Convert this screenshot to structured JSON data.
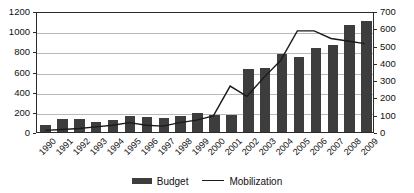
{
  "chart_data": {
    "type": "bar",
    "title": "",
    "subtitle": "",
    "xlabel": "",
    "ylabel": "",
    "grid": true,
    "legend_position": "bottom",
    "categories": [
      "1990",
      "1991",
      "1992",
      "1993",
      "1994",
      "1995",
      "1996",
      "1997",
      "1998",
      "1999",
      "2000",
      "2001",
      "2002",
      "2003",
      "2004",
      "2005",
      "2006",
      "2007",
      "2008",
      "2009"
    ],
    "series": [
      {
        "name": "Budget",
        "type": "bar",
        "axis": "left",
        "color": "#3d3d3d",
        "values": [
          65,
          130,
          125,
          100,
          115,
          155,
          150,
          140,
          155,
          190,
          165,
          165,
          625,
          640,
          770,
          745,
          835,
          865,
          1060,
          1100
        ]
      },
      {
        "name": "Mobilization",
        "type": "line",
        "axis": "right",
        "color": "#1a1a1a",
        "values": [
          10,
          15,
          20,
          30,
          40,
          55,
          40,
          35,
          55,
          70,
          95,
          270,
          210,
          320,
          420,
          595,
          595,
          550,
          535,
          520
        ]
      }
    ],
    "axes": {
      "left": {
        "min": 0,
        "max": 1200,
        "step": 200,
        "ticks": [
          "0",
          "200",
          "400",
          "600",
          "800",
          "1000",
          "1200"
        ]
      },
      "right": {
        "min": 0,
        "max": 700,
        "step": 100,
        "ticks": [
          "0",
          "100",
          "200",
          "300",
          "400",
          "500",
          "600",
          "700"
        ]
      }
    }
  },
  "legend": {
    "items": [
      {
        "label": "Budget",
        "swatch": "bar-swatch-icon"
      },
      {
        "label": "Mobilization",
        "swatch": "line-swatch-icon"
      }
    ]
  }
}
